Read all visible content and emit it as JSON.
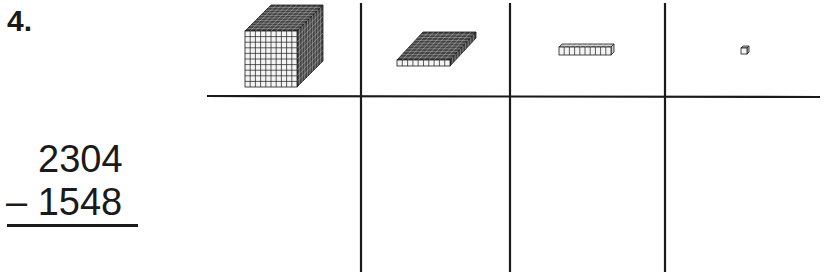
{
  "problem": {
    "number": "4.",
    "minuend": "2304",
    "subtrahend": "– 1548",
    "operation": "subtraction"
  },
  "place_value_chart": {
    "columns": [
      {
        "place": "thousands",
        "icon": "thousands-cube-icon"
      },
      {
        "place": "hundreds",
        "icon": "hundreds-flat-icon"
      },
      {
        "place": "tens",
        "icon": "tens-rod-icon"
      },
      {
        "place": "ones",
        "icon": "ones-unit-cube-icon"
      }
    ]
  },
  "colors": {
    "ink": "#1a1a1a",
    "block_dark": "#444444",
    "paper": "#ffffff"
  }
}
